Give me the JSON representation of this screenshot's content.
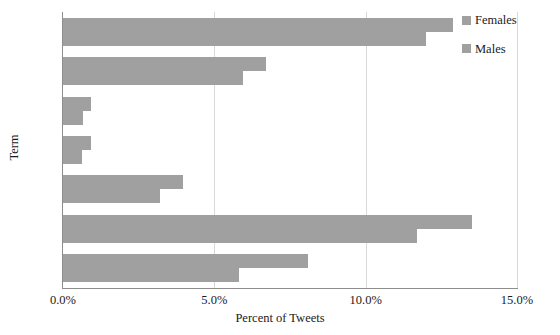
{
  "chart_data": {
    "type": "bar",
    "orientation": "horizontal",
    "title": "",
    "xlabel": "Percent of Tweets",
    "ylabel": "Term",
    "categories": [
      "you",
      "our",
      "she",
      "her",
      "me",
      "i",
      "my"
    ],
    "series": [
      {
        "name": "Females",
        "color": "#a0a0a0",
        "values": [
          12.9,
          6.7,
          0.93,
          0.93,
          3.95,
          13.5,
          8.1
        ]
      },
      {
        "name": "Males",
        "color": "#a0a0a0",
        "values": [
          12.0,
          5.95,
          0.66,
          0.63,
          3.2,
          11.7,
          5.8
        ]
      }
    ],
    "xlim": [
      0.0,
      15.0
    ],
    "xticks": [
      0.0,
      5.0,
      10.0,
      15.0
    ],
    "xtick_labels": [
      "0.0%",
      "5.0%",
      "10.0%",
      "15.0%"
    ],
    "grid": "vertical",
    "legend_position": "top-right",
    "legend_entries": [
      "Females",
      "Males"
    ],
    "axis_color": "#8e8e8e",
    "grid_color": "#d8d8d8"
  }
}
